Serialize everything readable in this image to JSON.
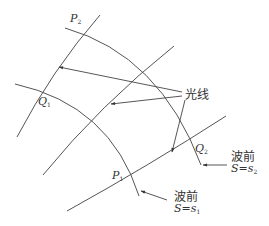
{
  "diagram": {
    "type": "wavefront-ray-diagram",
    "points": {
      "P1": {
        "letter": "P",
        "sub": "1"
      },
      "P2": {
        "letter": "P",
        "sub": "2"
      },
      "Q1": {
        "letter": "Q",
        "sub": "1"
      },
      "Q2": {
        "letter": "Q",
        "sub": "2"
      }
    },
    "ray_label": "光线",
    "wavefront_s2": {
      "title": "波前",
      "eq_left": "S",
      "eq_sign": "=",
      "eq_right": "s",
      "eq_sub": "2"
    },
    "wavefront_s1": {
      "title": "波前",
      "eq_left": "S",
      "eq_sign": "=",
      "eq_right": "s",
      "eq_sub": "1"
    },
    "stroke_color": "#555555",
    "text_color": "#333333"
  }
}
